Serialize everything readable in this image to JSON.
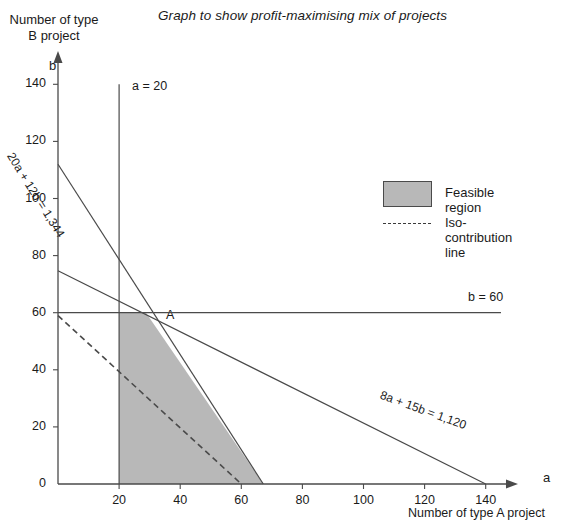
{
  "chart_data": {
    "type": "line",
    "title": "Graph to show profit-maximising mix of projects",
    "xlabel": "Number of type A project",
    "xlabel_symbol": "a",
    "ylabel": "Number of type B project",
    "ylabel_symbol": "b",
    "xlim": [
      0,
      145
    ],
    "ylim": [
      0,
      145
    ],
    "xticks": [
      0,
      20,
      40,
      60,
      80,
      100,
      120,
      140
    ],
    "yticks": [
      0,
      20,
      40,
      60,
      80,
      100,
      120,
      140
    ],
    "xtick_labels": [
      "0",
      "20",
      "40",
      "60",
      "80",
      "100",
      "120",
      "140"
    ],
    "ytick_labels": [
      "0",
      "20",
      "40",
      "60",
      "80",
      "100",
      "120",
      "140"
    ],
    "grid": false,
    "legend_position": "upper right",
    "series": [
      {
        "name": "20a + 12b = 1,344",
        "label": "20a + 12b = 1,344",
        "style": "solid",
        "points": [
          [
            0,
            112
          ],
          [
            67.2,
            0
          ]
        ]
      },
      {
        "name": "8a + 15b = 1,120",
        "label": "8a + 15b = 1,120",
        "style": "solid",
        "points": [
          [
            0,
            74.7
          ],
          [
            140,
            0
          ]
        ]
      },
      {
        "name": "b = 60",
        "label": "b = 60",
        "style": "solid",
        "points": [
          [
            0,
            60
          ],
          [
            145,
            60
          ]
        ]
      },
      {
        "name": "a = 20",
        "label": "a = 20",
        "style": "solid",
        "points": [
          [
            20,
            140
          ],
          [
            20,
            0
          ]
        ]
      },
      {
        "name": "Iso-contribution line",
        "label": "Iso-contribution line",
        "style": "dashed",
        "points": [
          [
            0,
            59
          ],
          [
            60,
            0
          ]
        ]
      }
    ],
    "feasible_region": {
      "label": "Feasible region",
      "fill": "#b8b8b8",
      "vertices": [
        [
          20,
          0
        ],
        [
          20,
          60
        ],
        [
          28.8,
          60
        ],
        [
          67.2,
          0
        ]
      ]
    },
    "annotations": [
      {
        "text": "A",
        "x": 28.8,
        "y": 60,
        "note": "optimal vertex"
      }
    ]
  },
  "chart": {
    "title": "Graph to show profit-maximising mix of projects",
    "y_axis_caption": "Number of type B project",
    "y_axis_symbol": "b",
    "x_axis_caption": "Number of type A project",
    "x_axis_symbol": "a",
    "vertex_label": "A",
    "line_labels": {
      "vertical_constraint": "a = 20",
      "horizontal_constraint": "b = 60",
      "constraint_1": "20a + 12b = 1,344",
      "constraint_2": "8a + 15b = 1,120"
    }
  },
  "legend": {
    "feasible_label": "Feasible region",
    "iso_label": "Iso-contribution line",
    "feasible_color": "#b8b8b8"
  },
  "colors": {
    "axis": "#4a4a4a",
    "line": "#4a4a4a",
    "region_fill": "#b8b8b8",
    "text": "#1a1a1a"
  }
}
